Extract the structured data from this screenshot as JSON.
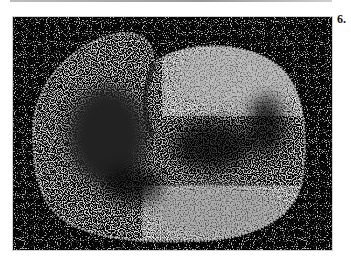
{
  "figure": {
    "panel_label": "6.",
    "colors": {
      "background": "#050505",
      "speckle": "#e8e8e8",
      "page": "#ffffff"
    }
  }
}
